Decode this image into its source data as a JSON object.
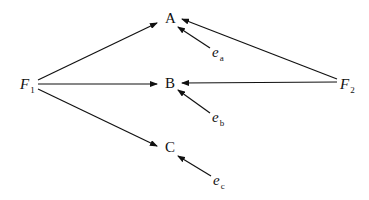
{
  "diagram": {
    "type": "path-diagram",
    "nodes": {
      "F1": {
        "base": "F",
        "sub": "1"
      },
      "F2": {
        "base": "F",
        "sub": "2"
      },
      "A": {
        "label": "A"
      },
      "B": {
        "label": "B"
      },
      "C": {
        "label": "C"
      },
      "ea": {
        "base": "e",
        "sub": "a"
      },
      "eb": {
        "base": "e",
        "sub": "b"
      },
      "ec": {
        "base": "e",
        "sub": "c"
      }
    },
    "edges": [
      {
        "from": "F1",
        "to": "A"
      },
      {
        "from": "F1",
        "to": "B"
      },
      {
        "from": "F1",
        "to": "C"
      },
      {
        "from": "F2",
        "to": "A"
      },
      {
        "from": "F2",
        "to": "B"
      },
      {
        "from": "ea",
        "to": "A"
      },
      {
        "from": "eb",
        "to": "B"
      },
      {
        "from": "ec",
        "to": "C"
      }
    ],
    "colors": {
      "line": "#111111",
      "background": "#ffffff"
    }
  }
}
